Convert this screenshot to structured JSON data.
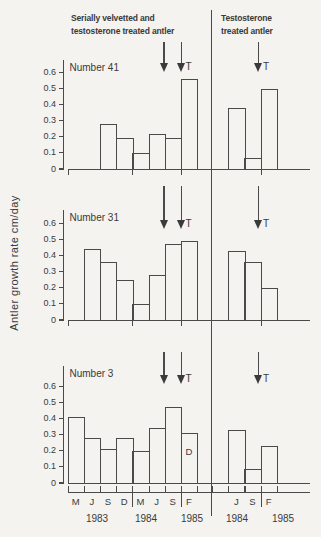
{
  "headers": {
    "left_line1": "Serially velvetted and",
    "left_line2": "testosterone treated antler",
    "right_line1": "Testosterone",
    "right_line2": "treated antler"
  },
  "ylabel": "Antler growth rate cm/day",
  "chart_data": {
    "type": "bar",
    "ylabel": "Antler growth rate cm/day",
    "ylim": [
      0,
      0.65
    ],
    "yticks": [
      0,
      0.1,
      0.2,
      0.3,
      0.4,
      0.5,
      0.6
    ],
    "ytick_labels": [
      "0",
      "0.1",
      "0.2",
      "0.3",
      "0.4",
      "0.5",
      "0.6"
    ],
    "group_headers": [
      "Serially velvetted and testosterone treated antler",
      "Testosterone treated antler"
    ],
    "x_months_left": [
      "M",
      "J",
      "S",
      "D",
      "M",
      "J",
      "S",
      "F"
    ],
    "x_months_right": [
      "",
      "J",
      "S",
      "F"
    ],
    "x_years": [
      {
        "label": "1983",
        "side": "left"
      },
      {
        "label": "1984",
        "side": "left"
      },
      {
        "label": "1985",
        "side": "left"
      },
      {
        "label": "1984",
        "side": "right"
      },
      {
        "label": "1985",
        "side": "right"
      }
    ],
    "panels": [
      {
        "label": "Number 41",
        "left_categories": [
          "M 1983",
          "J 1983",
          "S 1983",
          "D 1983",
          "M 1984",
          "J 1984",
          "S 1984",
          "F 1985"
        ],
        "left_values": [
          null,
          null,
          0.28,
          0.19,
          0.1,
          0.22,
          0.19,
          0.56
        ],
        "right_categories": [
          "M 1984",
          "J 1984",
          "S 1984",
          "F 1985"
        ],
        "right_values": [
          null,
          0.38,
          0.07,
          0.5
        ]
      },
      {
        "label": "Number 31",
        "left_categories": [
          "M 1983",
          "J 1983",
          "S 1983",
          "D 1983",
          "M 1984",
          "J 1984",
          "S 1984",
          "F 1985"
        ],
        "left_values": [
          null,
          0.44,
          0.36,
          0.25,
          0.1,
          0.28,
          0.47,
          0.49
        ],
        "right_categories": [
          "M 1984",
          "J 1984",
          "S 1984",
          "F 1985"
        ],
        "right_values": [
          null,
          0.43,
          0.36,
          0.2
        ]
      },
      {
        "label": "Number 3",
        "left_categories": [
          "M 1983",
          "J 1983",
          "S 1983",
          "D 1983",
          "M 1984",
          "J 1984",
          "S 1984",
          "F 1985"
        ],
        "left_values": [
          0.41,
          0.28,
          0.21,
          0.28,
          0.2,
          0.34,
          0.47,
          0.31
        ],
        "right_categories": [
          "M 1984",
          "J 1984",
          "S 1984",
          "F 1985"
        ],
        "right_values": [
          null,
          0.33,
          0.09,
          0.23
        ],
        "note": {
          "text": "D",
          "slot": 7
        }
      }
    ],
    "annotations": {
      "left_arrows": [
        {
          "label": ""
        },
        {
          "label": "T"
        }
      ],
      "right_arrows": [
        {
          "label": "T"
        }
      ]
    },
    "legend": "off",
    "grid": "off"
  },
  "colors": {
    "ink": "#3a3a3a",
    "line": "#4a4a4a",
    "background": "#f4f3f0"
  }
}
